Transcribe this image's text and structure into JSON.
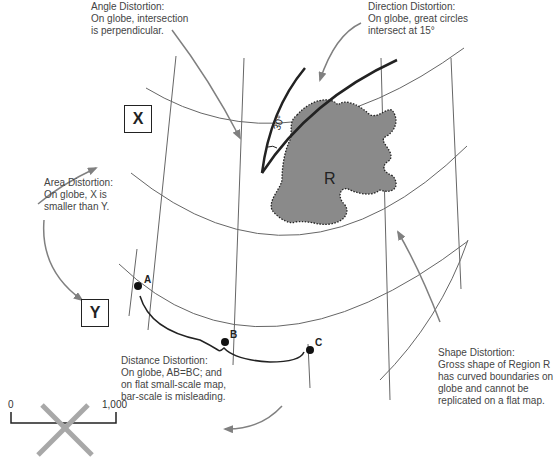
{
  "annotations": {
    "angle": {
      "title": "Angle Distortion:",
      "lines": [
        "On globe, intersection",
        "is perpendicular."
      ]
    },
    "direction": {
      "title": "Direction Distortion:",
      "lines": [
        "On globe, great circles",
        "intersect at 15°"
      ]
    },
    "area": {
      "title": "Area Distortion:",
      "lines": [
        "On globe, X is",
        "smaller than Y."
      ]
    },
    "distance": {
      "title": "Distance Distortion:",
      "lines": [
        "On globe, AB=BC; and",
        "on flat small-scale map,",
        "bar-scale is misleading."
      ]
    },
    "shape": {
      "title": "Shape Distortion:",
      "lines": [
        "Gross shape of Region R",
        "has curved boundaries on",
        "globe and cannot be",
        "replicated on a flat map."
      ]
    }
  },
  "boxes": {
    "x": "X",
    "y": "Y"
  },
  "points": {
    "a": "A",
    "b": "B",
    "c": "C"
  },
  "region": {
    "label": "R",
    "fill": "#8a8a8a"
  },
  "angle_mark": "30°",
  "scale_bar": {
    "start": "0",
    "end": "1,000",
    "crossed": true,
    "cross_color": "#a8a8a8"
  },
  "colors": {
    "grid": "#666666",
    "arrow": "#808080",
    "ink": "#222222"
  }
}
